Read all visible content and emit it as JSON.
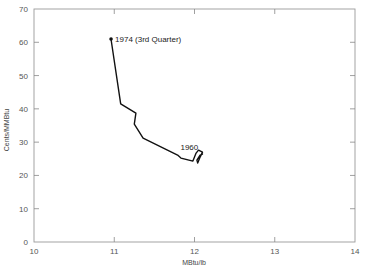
{
  "chart_data": {
    "type": "line",
    "title": "",
    "xlabel": "MBtu/lb",
    "ylabel": "Cents/MMBtu",
    "xlim": [
      10,
      14
    ],
    "ylim": [
      0,
      70
    ],
    "xticks": [
      10,
      11,
      12,
      13,
      14
    ],
    "yticks": [
      0,
      10,
      20,
      30,
      40,
      50,
      60,
      70
    ],
    "grid": false,
    "legend": null,
    "series": [
      {
        "name": "Coal cost vs heat content (1960 to 1974 3rd Quarter)",
        "x": [
          10.96,
          11.08,
          11.27,
          11.25,
          11.36,
          11.79,
          11.83,
          11.98,
          12.02,
          12.05,
          12.1,
          12.07,
          12.04,
          12.03,
          12.07,
          12.1
        ],
        "y": [
          61.0,
          41.5,
          38.7,
          35.4,
          31.2,
          26.1,
          25.2,
          24.3,
          26.7,
          27.6,
          27.0,
          25.5,
          23.7,
          24.6,
          26.1,
          26.4
        ]
      }
    ],
    "annotations": [
      {
        "text": "1974 (3rd Quarter)",
        "x": 10.96,
        "y": 61.0
      },
      {
        "text": "1960",
        "x": 11.9,
        "y": 27.5
      }
    ]
  },
  "labels": {
    "xlabel": "MBtu/lb",
    "ylabel": "Cents/MMBtu",
    "annot_start": "1974 (3rd Quarter)",
    "annot_end": "1960"
  }
}
